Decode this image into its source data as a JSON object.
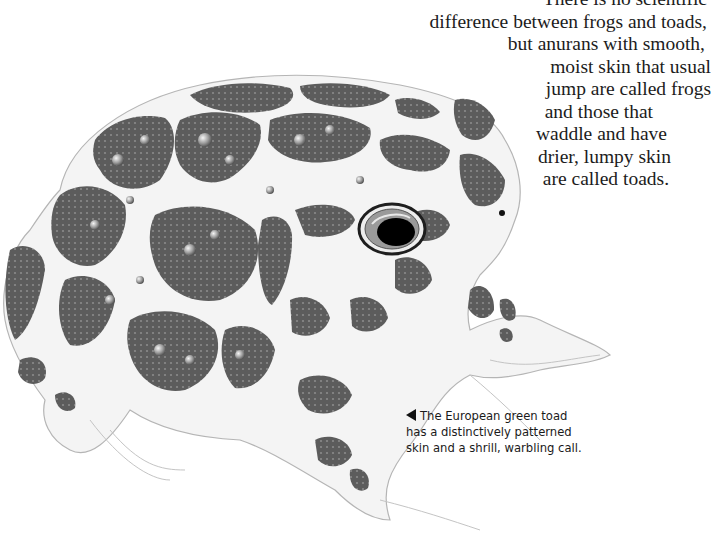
{
  "body_text": {
    "lines": [
      "There is no scientific",
      "difference between frogs and toads,",
      "but anurans with smooth,",
      "moist skin that usual",
      "jump are called frogs",
      "and those that",
      "waddle and have",
      "drier, lumpy skin",
      "are called toads."
    ]
  },
  "illustration": {
    "subject": "European green toad",
    "colors": {
      "patch": "#5a5a5a",
      "skin": "#f2f2f2",
      "outline": "#9a9a9a",
      "eye_ring": "#222222",
      "pupil": "#000000"
    }
  },
  "caption": {
    "pointer_icon": "left-pointing-triangle",
    "lines": [
      "The European green toad",
      "has a distinctively patterned",
      "skin and a shrill, warbling call."
    ]
  }
}
